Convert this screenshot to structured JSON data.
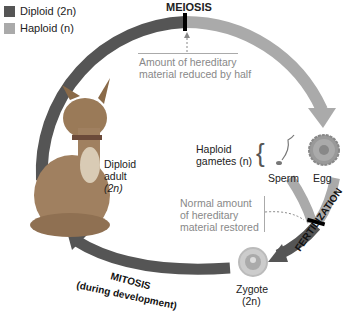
{
  "legend": {
    "diploid": {
      "label": "Diploid (2n)",
      "color": "#555555"
    },
    "haploid": {
      "label": "Haploid (n)",
      "color": "#aaaaaa"
    }
  },
  "stages": {
    "meiosis": "MEIOSIS",
    "fertilization": "FERTILIZATION",
    "mitosis": "MITOSIS",
    "mitosis_note": "(during development)"
  },
  "annotations": {
    "reduced_line1": "Amount of hereditary",
    "reduced_line2": "material reduced by half",
    "restored_line1": "Normal amount",
    "restored_line2": "of hereditary",
    "restored_line3": "material restored"
  },
  "labels": {
    "adult_line1": "Diploid",
    "adult_line2": "adult",
    "adult_line3": "(2n)",
    "gametes_line1": "Haploid",
    "gametes_line2": "gametes (n)",
    "sperm": "Sperm",
    "egg": "Egg",
    "zygote": "Zygote",
    "zygote_ploidy": "(2n)"
  }
}
